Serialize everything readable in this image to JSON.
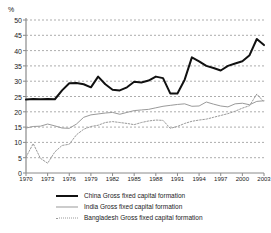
{
  "chart_data": {
    "type": "line",
    "title": "",
    "subtitle": "",
    "xlabel": "",
    "ylabel": "%",
    "unit_label": "%",
    "xlim": [
      1970,
      2003
    ],
    "ylim": [
      0,
      50
    ],
    "ytick_step": 5,
    "xtick_step": 3,
    "grid": true,
    "grid_style": "horizontal-dashed",
    "legend_position": "bottom",
    "y_ticks": [
      0,
      5,
      10,
      15,
      20,
      25,
      30,
      35,
      40,
      45,
      50
    ],
    "x_ticks": [
      1970,
      1973,
      1976,
      1979,
      1982,
      1985,
      1988,
      1991,
      1994,
      1997,
      2000,
      2003
    ],
    "x": [
      1970,
      1971,
      1972,
      1973,
      1974,
      1975,
      1976,
      1977,
      1978,
      1979,
      1980,
      1981,
      1982,
      1983,
      1984,
      1985,
      1986,
      1987,
      1988,
      1989,
      1990,
      1991,
      1992,
      1993,
      1994,
      1995,
      1996,
      1997,
      1998,
      1999,
      2000,
      2001,
      2002,
      2003
    ],
    "series": [
      {
        "name": "China Gross fixed capital formation",
        "color": "#111111",
        "style": "solid",
        "width": 2,
        "values": [
          24.0,
          24.2,
          24.1,
          24.2,
          24.1,
          27.0,
          29.3,
          29.4,
          29.0,
          28.0,
          31.5,
          29.0,
          27.2,
          27.0,
          28.0,
          29.8,
          29.6,
          30.2,
          31.5,
          31.0,
          26.0,
          26.0,
          30.5,
          37.8,
          36.5,
          35.0,
          34.3,
          33.5,
          35.0,
          35.8,
          36.5,
          38.5,
          43.8,
          41.8
        ]
      },
      {
        "name": "India Gross fixed capital formation",
        "color": "#9a9a9a",
        "style": "solid",
        "width": 1,
        "values": [
          14.7,
          15.2,
          15.3,
          16.0,
          15.4,
          14.7,
          14.6,
          16.0,
          18.2,
          19.0,
          19.3,
          19.6,
          19.8,
          19.2,
          19.8,
          20.4,
          20.6,
          20.8,
          21.3,
          21.8,
          22.1,
          22.4,
          22.6,
          21.8,
          21.9,
          23.2,
          22.5,
          21.9,
          21.6,
          22.6,
          22.8,
          22.3,
          23.4,
          23.6
        ]
      },
      {
        "name": "Bangladesh Gross fixed capital formation",
        "color": "#9a9a9a",
        "style": "dotted",
        "width": 1,
        "values": [
          5.2,
          9.6,
          4.8,
          3.2,
          6.9,
          9.0,
          9.4,
          12.5,
          14.3,
          15.2,
          15.6,
          16.5,
          16.8,
          16.5,
          16.2,
          15.8,
          16.5,
          17.0,
          17.3,
          17.2,
          14.6,
          15.2,
          16.2,
          16.9,
          17.3,
          17.6,
          18.2,
          18.8,
          19.4,
          20.2,
          21.2,
          22.0,
          25.8,
          23.2
        ]
      }
    ]
  },
  "legend": {
    "items": [
      {
        "label": "China Gross fixed capital formation",
        "swatch": "sw-china"
      },
      {
        "label": "India Gross fixed capital formation",
        "swatch": "sw-india"
      },
      {
        "label": "Bangladesh Gross fixed capital formation",
        "swatch": "sw-bang"
      }
    ]
  }
}
